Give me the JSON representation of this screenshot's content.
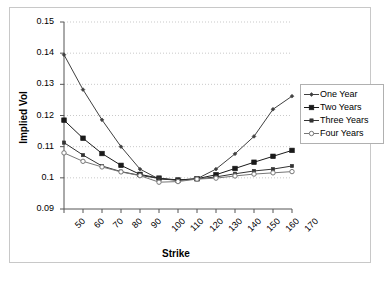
{
  "chart_data": {
    "type": "line",
    "title": "",
    "xlabel": "Strike",
    "ylabel": "Implied Vol",
    "categories": [
      50,
      60,
      70,
      80,
      90,
      100,
      110,
      120,
      130,
      140,
      150,
      160,
      170
    ],
    "xtick_labels": [
      "50",
      "60",
      "70",
      "80",
      "90",
      "100",
      "110",
      "120",
      "130",
      "140",
      "150",
      "160",
      "170"
    ],
    "ytick_labels": [
      "0.09",
      "0.1",
      "0.11",
      "0.12",
      "0.13",
      "0.14",
      "0.15"
    ],
    "ylim": [
      0.09,
      0.15
    ],
    "ytick_step": 0.01,
    "grid": "horizontal-dotted",
    "legend_position": "right",
    "series": [
      {
        "name": "One Year",
        "marker": "small-diamond",
        "color": "#404040",
        "values": [
          0.1395,
          0.1283,
          0.1186,
          0.11,
          0.1028,
          0.0996,
          0.0993,
          0.0997,
          0.1028,
          0.1077,
          0.1133,
          0.122,
          0.1262
        ]
      },
      {
        "name": "Two Years",
        "marker": "filled-square",
        "color": "#1a1a1a",
        "values": [
          0.1185,
          0.1127,
          0.1078,
          0.104,
          0.1011,
          0.0999,
          0.0993,
          0.0997,
          0.101,
          0.103,
          0.105,
          0.1069,
          0.1088
        ]
      },
      {
        "name": "Three Years",
        "marker": "small-filled",
        "color": "#333333",
        "values": [
          0.1113,
          0.1073,
          0.1038,
          0.102,
          0.1008,
          0.0998,
          0.0992,
          0.0996,
          0.1003,
          0.1013,
          0.1022,
          0.1028,
          0.1038
        ]
      },
      {
        "name": "Four Years",
        "marker": "open-circle",
        "color": "#777777",
        "values": [
          0.108,
          0.1053,
          0.1035,
          0.1019,
          0.1007,
          0.0986,
          0.0988,
          0.0996,
          0.0999,
          0.1006,
          0.1012,
          0.1016,
          0.102
        ]
      }
    ]
  }
}
